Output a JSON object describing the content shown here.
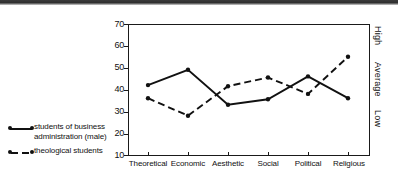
{
  "chart_data": {
    "type": "line",
    "title": "",
    "xlabel": "",
    "ylabel": "",
    "ylim": [
      10,
      70
    ],
    "yticks": [
      10,
      20,
      30,
      40,
      50,
      60,
      70
    ],
    "grid": false,
    "legend_position": "left-outside",
    "categories": [
      "Theoretical",
      "Economic",
      "Aesthetic",
      "Social",
      "Political",
      "Religious"
    ],
    "right_axis_labels": [
      "High",
      "Average",
      "Low"
    ],
    "series": [
      {
        "name": "students of business administration (male)",
        "style": "solid",
        "values": [
          42,
          49,
          33,
          35.5,
          46,
          36
        ]
      },
      {
        "name": "theological students",
        "style": "dashed",
        "values": [
          36,
          28,
          41.5,
          45.5,
          38,
          55
        ]
      }
    ]
  },
  "axes": {
    "y_tick_labels": [
      "70",
      "60",
      "50",
      "40",
      "30",
      "20",
      "10"
    ],
    "x_tick_labels": [
      "Theoretical",
      "Economic",
      "Aesthetic",
      "Social",
      "Political",
      "Religious"
    ],
    "right_labels": [
      "High",
      "Average",
      "Low"
    ]
  },
  "legend": {
    "items": [
      {
        "label_line1": "students of business",
        "label_line2": "administration (male)",
        "style": "solid"
      },
      {
        "label_line1": "theological students",
        "label_line2": "",
        "style": "dashed"
      }
    ]
  },
  "colors": {
    "ink": "#111111",
    "background": "#ffffff"
  }
}
